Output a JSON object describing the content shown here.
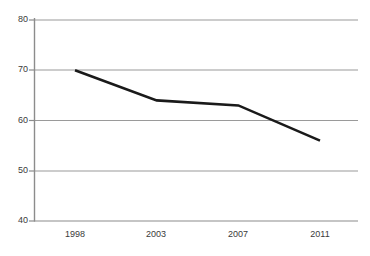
{
  "chart_data": {
    "type": "line",
    "title": "",
    "subtitle": "",
    "xlabel": "",
    "ylabel": "",
    "categories": [
      "1998",
      "2003",
      "2007",
      "2011"
    ],
    "x": [
      1998,
      2003,
      2007,
      2011
    ],
    "values": [
      70,
      64,
      63,
      56
    ],
    "series": [
      {
        "name": "",
        "values": [
          70,
          64,
          63,
          56
        ]
      }
    ],
    "ylim": [
      40,
      80
    ],
    "yticks": [
      40,
      50,
      60,
      70,
      80
    ],
    "ytick_labels": [
      "40",
      "50",
      "60",
      "70",
      "80"
    ],
    "xtick_labels": [
      "1998",
      "2003",
      "2007",
      "2011"
    ],
    "grid": "horizontal",
    "legend": "none",
    "annotations": [],
    "colors": {
      "line": "#1a1a1a",
      "grid": "#9a9a9a",
      "axis": "#8c8c8c",
      "background": "#ffffff",
      "tick_text": "#3a3a3a"
    },
    "line_width": 2.6,
    "markers": "none"
  },
  "axes": {
    "y_labels": [
      {
        "text": "80",
        "top": 15
      },
      {
        "text": "70",
        "top": 65
      },
      {
        "text": "60",
        "top": 116
      },
      {
        "text": "50",
        "top": 166
      },
      {
        "text": "40",
        "top": 216
      }
    ],
    "x_labels": [
      {
        "text": "1998",
        "left": 55
      },
      {
        "text": "2003",
        "left": 136
      },
      {
        "text": "2007",
        "left": 218
      },
      {
        "text": "2011",
        "left": 300
      }
    ]
  }
}
